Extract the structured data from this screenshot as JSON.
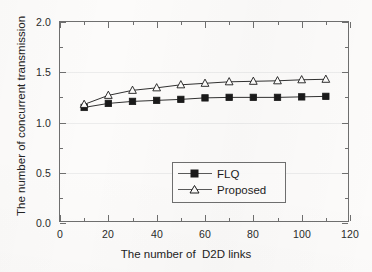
{
  "chart_data": {
    "type": "line",
    "title": "",
    "xlabel": "The number of  D2D links",
    "ylabel": "The number of concurrent transmission",
    "xlim": [
      0,
      120
    ],
    "ylim": [
      0,
      2.0
    ],
    "xticks": [
      0,
      20,
      40,
      60,
      80,
      100,
      120
    ],
    "yticks": [
      "0.0",
      "0.5",
      "1.0",
      "1.5",
      "2.0"
    ],
    "x_minor_step": 10,
    "y_minor_step": 0.25,
    "grid": true,
    "legend_position": "lower right",
    "x": [
      10,
      20,
      30,
      40,
      50,
      60,
      70,
      80,
      90,
      100,
      110
    ],
    "series": [
      {
        "name": "FLQ",
        "marker": "filled-square",
        "color": "#1a1a1a",
        "values": [
          1.15,
          1.19,
          1.21,
          1.22,
          1.23,
          1.245,
          1.25,
          1.25,
          1.25,
          1.255,
          1.26
        ]
      },
      {
        "name": "Proposed",
        "marker": "open-triangle",
        "color": "#1a1a1a",
        "values": [
          1.18,
          1.27,
          1.32,
          1.345,
          1.375,
          1.39,
          1.405,
          1.41,
          1.415,
          1.425,
          1.43
        ]
      }
    ]
  },
  "axes": {
    "x_tick_labels": [
      "0",
      "20",
      "40",
      "60",
      "80",
      "100",
      "120"
    ],
    "y_tick_labels": [
      "0.0",
      "0.5",
      "1.0",
      "1.5",
      "2.0"
    ],
    "x_title": "The number of  D2D links",
    "y_title": "The number of concurrent transmission"
  },
  "legend": {
    "items": [
      {
        "label": "FLQ",
        "marker": "filled-square"
      },
      {
        "label": "Proposed",
        "marker": "open-triangle"
      }
    ]
  },
  "colors": {
    "axis": "#6f6f6f",
    "grid": "#ececec",
    "series": "#1a1a1a",
    "background": "#fcfbfa",
    "text": "#232323"
  }
}
